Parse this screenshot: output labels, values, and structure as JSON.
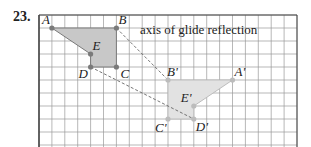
{
  "problem": {
    "number": "23."
  },
  "figure": {
    "axis_label": "axis of glide reflection",
    "grid": {
      "columns": 20,
      "rows": 10
    },
    "colors": {
      "original_fill": "#c8c8c8",
      "image_fill": "#e2e2e2",
      "point": "#7a7a7a",
      "grid": "#9a9a9a",
      "border": "#444444",
      "dashed": "#666666"
    },
    "original": {
      "points": [
        {
          "name": "A",
          "x": 1,
          "y": 1
        },
        {
          "name": "B",
          "x": 6,
          "y": 1
        },
        {
          "name": "C",
          "x": 6,
          "y": 4
        },
        {
          "name": "D",
          "x": 4,
          "y": 4
        },
        {
          "name": "E",
          "x": 4,
          "y": 3
        }
      ]
    },
    "image": {
      "points": [
        {
          "name": "B'",
          "x": 10,
          "y": 5
        },
        {
          "name": "A'",
          "x": 15,
          "y": 5
        },
        {
          "name": "E'",
          "x": 12,
          "y": 7
        },
        {
          "name": "D'",
          "x": 12,
          "y": 8
        },
        {
          "name": "C'",
          "x": 10,
          "y": 8
        }
      ]
    },
    "dashed_segments": [
      [
        "B",
        "B'"
      ],
      [
        "D",
        "D'"
      ]
    ]
  }
}
